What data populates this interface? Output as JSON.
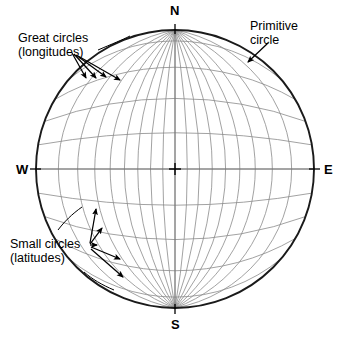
{
  "figure": {
    "kind": "stereographic-projection-net",
    "net_type": "equal-angle Wulff stereonet",
    "background_color": "#ffffff",
    "grid_color": "#8a8a8a",
    "primitive_color": "#1a1a1a",
    "annotation_color": "#000000"
  },
  "cardinals": {
    "north": "N",
    "south": "S",
    "west": "W",
    "east": "E"
  },
  "callouts": {
    "great_circles": {
      "line1": "Great circles",
      "line2": "(longitudes)",
      "arrow_count": 4
    },
    "small_circles": {
      "line1": "Small circles",
      "line2": "(latitudes)",
      "arrow_count": 5
    },
    "primitive_circle": {
      "line1": "Primitive",
      "line2": "circle",
      "arrow_count": 1
    }
  },
  "chart_data": {
    "type": "scatter",
    "title": "",
    "subtitle": "",
    "xlabel": "",
    "ylabel": "",
    "projection": "stereographic (equal-angle)",
    "center": {
      "x": 175,
      "y": 169
    },
    "radius": 139,
    "grid": true,
    "grid_interval_degrees": 10,
    "longitude_degrees": [
      -80,
      -70,
      -60,
      -50,
      -40,
      -30,
      -20,
      -10,
      0,
      10,
      20,
      30,
      40,
      50,
      60,
      70,
      80
    ],
    "latitude_degrees": [
      -80,
      -70,
      -60,
      -50,
      -40,
      -30,
      -20,
      -10,
      0,
      10,
      20,
      30,
      40,
      50,
      60,
      70,
      80
    ],
    "axis_ticks": [
      "N",
      "E",
      "S",
      "W"
    ],
    "tick_azimuths_degrees": [
      0,
      90,
      180,
      270
    ],
    "center_marker": "cross",
    "legend": [
      "Great circles (longitudes)",
      "Small circles (latitudes)",
      "Primitive circle"
    ],
    "legend_position": "annotations"
  }
}
